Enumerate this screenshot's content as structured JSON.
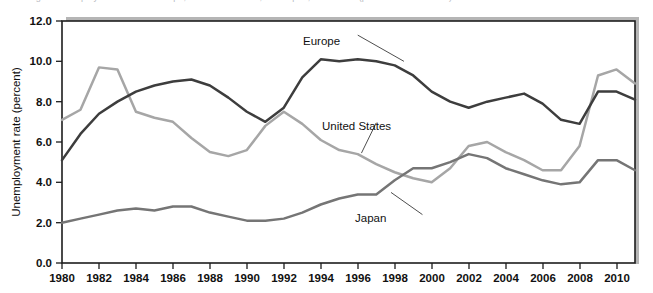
{
  "figure": {
    "caption_top": "Figure   Unemployment rates in Europe, the United States, and Japan, 1980-2011 (percent of labor force)",
    "ylabel": "Unemployment rate (percent)"
  },
  "axes": {
    "y_ticks": [
      "0.0",
      "2.0",
      "4.0",
      "6.0",
      "8.0",
      "10.0",
      "12.0"
    ],
    "x_ticks": [
      "1980",
      "1982",
      "1984",
      "1986",
      "1988",
      "1990",
      "1992",
      "1994",
      "1996",
      "1998",
      "2000",
      "2002",
      "2004",
      "2006",
      "2008",
      "2010"
    ]
  },
  "annotations": {
    "europe": "Europe",
    "united_states": "United States",
    "japan": "Japan"
  },
  "colors": {
    "europe": "#3d3d3d",
    "united_states": "#a6a6a6",
    "japan": "#757575",
    "axis": "#1d1d1d",
    "plot_shadow": "#b5b5b5"
  },
  "chart_data": {
    "type": "line",
    "title": "",
    "subtitle": "",
    "xlabel": "",
    "ylabel": "Unemployment rate (percent)",
    "xlim": [
      1980,
      2011
    ],
    "ylim": [
      0.0,
      12.0
    ],
    "ytick_step": 2.0,
    "xtick_step": 2,
    "grid": false,
    "legend": "inline-annotations",
    "x": [
      1980,
      1981,
      1982,
      1983,
      1984,
      1985,
      1986,
      1987,
      1988,
      1989,
      1990,
      1991,
      1992,
      1993,
      1994,
      1995,
      1996,
      1997,
      1998,
      1999,
      2000,
      2001,
      2002,
      2003,
      2004,
      2005,
      2006,
      2007,
      2008,
      2009,
      2010,
      2011
    ],
    "series": [
      {
        "name": "Europe",
        "color": "#3d3d3d",
        "values": [
          5.1,
          6.4,
          7.4,
          8.0,
          8.5,
          8.8,
          9.0,
          9.1,
          8.8,
          8.2,
          7.5,
          7.0,
          7.7,
          9.2,
          10.1,
          10.0,
          10.1,
          10.0,
          9.8,
          9.3,
          8.5,
          8.0,
          7.7,
          8.0,
          8.2,
          8.4,
          7.9,
          7.1,
          6.9,
          8.5,
          8.5,
          8.1
        ]
      },
      {
        "name": "United States",
        "color": "#a6a6a6",
        "values": [
          7.1,
          7.6,
          9.7,
          9.6,
          7.5,
          7.2,
          7.0,
          6.2,
          5.5,
          5.3,
          5.6,
          6.8,
          7.5,
          6.9,
          6.1,
          5.6,
          5.4,
          4.9,
          4.5,
          4.2,
          4.0,
          4.7,
          5.8,
          6.0,
          5.5,
          5.1,
          4.6,
          4.6,
          5.8,
          9.3,
          9.6,
          8.9
        ]
      },
      {
        "name": "Japan",
        "color": "#757575",
        "values": [
          2.0,
          2.2,
          2.4,
          2.6,
          2.7,
          2.6,
          2.8,
          2.8,
          2.5,
          2.3,
          2.1,
          2.1,
          2.2,
          2.5,
          2.9,
          3.2,
          3.4,
          3.4,
          4.1,
          4.7,
          4.7,
          5.0,
          5.4,
          5.2,
          4.7,
          4.4,
          4.1,
          3.9,
          4.0,
          5.1,
          5.1,
          4.6
        ]
      }
    ],
    "annotations": [
      {
        "text": "Europe",
        "x": 1996,
        "y": 11.3,
        "points_to": {
          "x": 1998.5,
          "y": 10.0
        }
      },
      {
        "text": "United States",
        "x": 1997,
        "y": 6.95,
        "points_to": {
          "x": 1996.2,
          "y": 5.45
        }
      },
      {
        "text": "Japan",
        "x": 1999.5,
        "y": 2.4,
        "points_to": {
          "x": 1997.8,
          "y": 3.5
        }
      }
    ]
  }
}
